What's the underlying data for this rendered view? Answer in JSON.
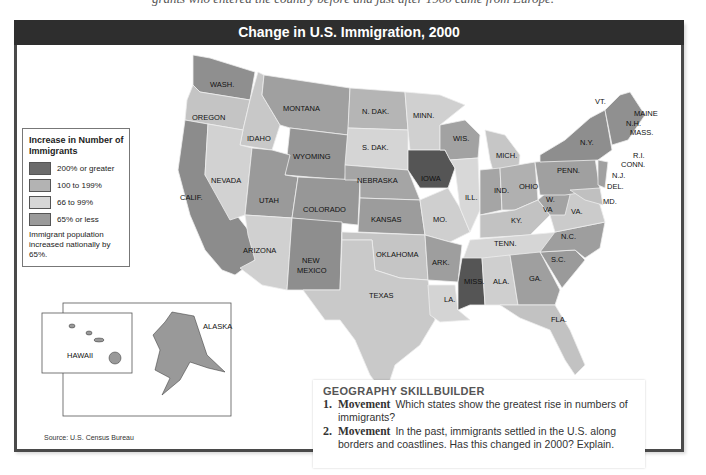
{
  "context_text": "grants who entered the country before and just after 1900 came from Europe.",
  "map": {
    "title": "Change in U.S. Immigration, 2000",
    "legend": {
      "title": "Increase in Number of Immigrants",
      "items": [
        {
          "label": "200% or greater",
          "color": "#6b6b6b"
        },
        {
          "label": "100 to 199%",
          "color": "#b3b3b3"
        },
        {
          "label": "66 to 99%",
          "color": "#d6d6d6"
        },
        {
          "label": "65% or less",
          "color": "#9a9a9a"
        }
      ],
      "note": "Immigrant population increased nationally by 65%."
    },
    "states": {
      "wash": "WASH.",
      "oregon": "OREGON",
      "calif": "CALIF.",
      "idaho": "IDAHO",
      "nevada": "NEVADA",
      "montana": "MONTANA",
      "wyoming": "WYOMING",
      "utah": "UTAH",
      "arizona": "ARIZONA",
      "colorado": "COLORADO",
      "new_mexico_1": "NEW",
      "new_mexico_2": "MEXICO",
      "n_dak": "N. DAK.",
      "s_dak": "S. DAK.",
      "nebraska": "NEBRASKA",
      "kansas": "KANSAS",
      "oklahoma": "OKLAHOMA",
      "texas": "TEXAS",
      "minn": "MINN.",
      "iowa": "IOWA",
      "mo": "MO.",
      "ark": "ARK.",
      "la": "LA.",
      "wis": "WIS.",
      "ill": "ILL.",
      "mich": "MICH.",
      "ind": "IND.",
      "ohio": "OHIO",
      "ky": "KY.",
      "tenn": "TENN.",
      "miss": "MISS.",
      "ala": "ALA.",
      "ga": "GA.",
      "fla": "FLA.",
      "sc": "S.C.",
      "nc": "N.C.",
      "va": "VA.",
      "wva_1": "W.",
      "wva_2": "VA",
      "penn": "PENN.",
      "ny": "N.Y.",
      "vt": "VT.",
      "nh": "N.H.",
      "maine": "MAINE",
      "mass": "MASS.",
      "ri": "R.I.",
      "conn": "CONN.",
      "nj": "N.J.",
      "del": "DEL.",
      "md": "MD.",
      "alaska": "ALASKA",
      "hawaii": "HAWAII"
    },
    "source": "Source: U.S. Census Bureau"
  },
  "skillbuilder": {
    "title": "GEOGRAPHY SKILLBUILDER",
    "questions": [
      {
        "num": "1.",
        "keyword": "Movement",
        "text": "Which states show the greatest rise in numbers of immigrants?"
      },
      {
        "num": "2.",
        "keyword": "Movement",
        "text": "In the past, immigrants settled in the U.S. along borders and coastlines. Has this changed in 2000? Explain."
      }
    ]
  }
}
